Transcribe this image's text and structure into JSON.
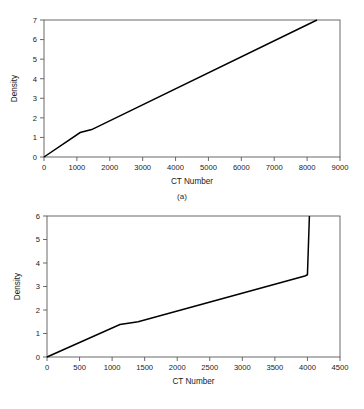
{
  "figure": {
    "background_color": "#ffffff",
    "line_color": "#000000",
    "axis_color": "#5a5a5a"
  },
  "panels": [
    {
      "id": "a",
      "caption": "(a)",
      "xlabel": "CT Number",
      "ylabel": "Density"
    },
    {
      "id": "b",
      "caption": "(b)",
      "xlabel": "CT Number",
      "ylabel": "Density"
    }
  ],
  "chart_data": [
    {
      "type": "line",
      "panel": "(a)",
      "title": "",
      "xlabel": "CT Number",
      "ylabel": "Density",
      "xlim": [
        0,
        9000
      ],
      "ylim": [
        0,
        7
      ],
      "xticks": [
        0,
        1000,
        2000,
        3000,
        4000,
        5000,
        6000,
        7000,
        8000,
        9000
      ],
      "yticks": [
        0,
        1,
        2,
        3,
        4,
        5,
        6,
        7
      ],
      "xtick_labels": [
        "0",
        "1000",
        "2000",
        "3000",
        "4000",
        "5000",
        "6000",
        "7000",
        "8000",
        "9000"
      ],
      "ytick_labels": [
        "0",
        "1",
        "2",
        "3",
        "4",
        "5",
        "6",
        "7"
      ],
      "grid": false,
      "legend": false,
      "series": [
        {
          "name": "CT to density calibration",
          "x": [
            0,
            1100,
            1450,
            8300
          ],
          "y": [
            0,
            1.25,
            1.4,
            7.0
          ]
        }
      ]
    },
    {
      "type": "line",
      "panel": "(b)",
      "title": "",
      "xlabel": "CT Number",
      "ylabel": "Density",
      "xlim": [
        0,
        4500
      ],
      "ylim": [
        0,
        6
      ],
      "xticks": [
        0,
        500,
        1000,
        1500,
        2000,
        2500,
        3000,
        3500,
        4000,
        4500
      ],
      "yticks": [
        0,
        1,
        2,
        3,
        4,
        5,
        6
      ],
      "xtick_labels": [
        "0",
        "500",
        "1000",
        "1500",
        "2000",
        "2500",
        "3000",
        "3500",
        "4000",
        "4500"
      ],
      "ytick_labels": [
        "0",
        "1",
        "2",
        "3",
        "4",
        "5",
        "6"
      ],
      "grid": false,
      "legend": false,
      "series": [
        {
          "name": "CT to density calibration",
          "x": [
            0,
            1120,
            1400,
            3960,
            4000,
            4030
          ],
          "y": [
            0,
            1.38,
            1.5,
            3.45,
            3.5,
            6.0
          ]
        }
      ]
    }
  ]
}
